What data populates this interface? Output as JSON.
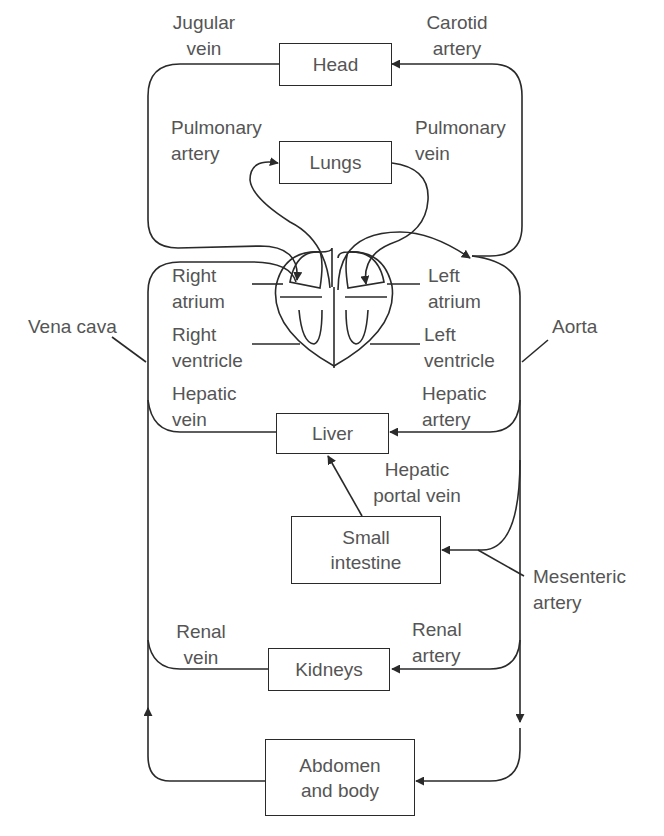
{
  "diagram": {
    "type": "circulatory-system-flow",
    "organs": {
      "head": "Head",
      "lungs": "Lungs",
      "liver": "Liver",
      "small_intestine": [
        "Small",
        "intestine"
      ],
      "kidneys": "Kidneys",
      "abdomen": [
        "Abdomen",
        "and body"
      ]
    },
    "heart": {
      "right_atrium": [
        "Right",
        "atrium"
      ],
      "right_ventricle": [
        "Right",
        "ventricle"
      ],
      "left_atrium": [
        "Left",
        "atrium"
      ],
      "left_ventricle": [
        "Left",
        "ventricle"
      ]
    },
    "vessels": {
      "jugular_vein": [
        "Jugular",
        "vein"
      ],
      "carotid_artery": [
        "Carotid",
        "artery"
      ],
      "pulmonary_artery": [
        "Pulmonary",
        "artery"
      ],
      "pulmonary_vein": [
        "Pulmonary",
        "vein"
      ],
      "vena_cava": "Vena cava",
      "aorta": "Aorta",
      "hepatic_vein": [
        "Hepatic",
        "vein"
      ],
      "hepatic_artery": [
        "Hepatic",
        "artery"
      ],
      "hepatic_portal_vein": [
        "Hepatic",
        "portal vein"
      ],
      "mesenteric_artery": [
        "Mesenteric",
        "artery"
      ],
      "renal_vein": [
        "Renal",
        "vein"
      ],
      "renal_artery": [
        "Renal",
        "artery"
      ]
    },
    "colors": {
      "line": "#2a2a2a",
      "text": "#555555",
      "background": "#ffffff"
    }
  }
}
